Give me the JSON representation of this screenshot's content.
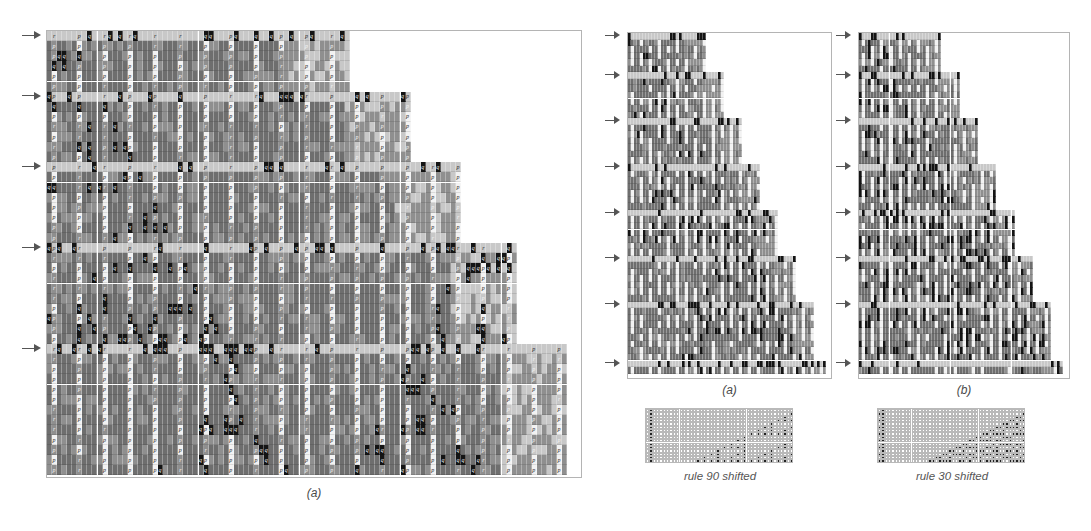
{
  "figure": {
    "title_visible": false,
    "background": "#ffffff"
  },
  "palette": {
    "cell_light": "#c8c8c8",
    "cell_mid": "#8f8f8f",
    "cell_dark": "#6e6e6e",
    "cell_white": "#f2f2f2",
    "cell_black": "#141414",
    "glyph_dark": "#2a2a2a",
    "glyph_light": "#f4f4f4",
    "frame": "#b4b4b4",
    "arrow": "#555555",
    "caption": "#4a4a4a",
    "minigrid_line": "#b9b9b9",
    "minicell_on": "#222222",
    "minicell_off": "#ffffff"
  },
  "panels": {
    "left": {
      "caption": "(a)",
      "name": "mobile-automaton-emulation-panel-a",
      "x": 46,
      "y": 30,
      "w": 536,
      "h": 448,
      "cell_w": 5.05,
      "cell_h": 10.1,
      "cols": 103,
      "rows": 44,
      "arrow_rows": [
        0,
        6,
        13,
        21,
        31
      ],
      "block_letters": [
        "p",
        "q",
        "r"
      ]
    },
    "mid": {
      "caption": "(a)",
      "name": "rule90-emulation-panel",
      "x": 627,
      "y": 32,
      "w": 205,
      "h": 347,
      "cell_w": 3.0,
      "cell_h": 6.55,
      "cols": 66,
      "rows": 52,
      "arrow_rows": [
        0,
        6,
        13,
        20,
        27,
        34,
        41,
        50
      ]
    },
    "right": {
      "caption": "(b)",
      "name": "rule30-emulation-panel",
      "x": 858,
      "y": 32,
      "w": 212,
      "h": 347,
      "cell_w": 3.05,
      "cell_h": 6.55,
      "cols": 67,
      "rows": 52,
      "arrow_rows": [
        0,
        6,
        13,
        20,
        27,
        34,
        41,
        50
      ]
    }
  },
  "mini": {
    "left": {
      "label": "rule 90 shifted",
      "name": "rule-90-shifted-minigrid",
      "x": 645,
      "y": 408,
      "w": 148,
      "h": 55,
      "cols": 44,
      "rows": 16,
      "cell": 3.35,
      "rule": 90,
      "shift": 1
    },
    "right": {
      "label": "rule 30 shifted",
      "name": "rule-30-shifted-minigrid",
      "x": 877,
      "y": 408,
      "w": 148,
      "h": 55,
      "cols": 44,
      "rows": 16,
      "cell": 3.35,
      "rule": 30,
      "shift": 1
    }
  },
  "captions": {
    "left_a": {
      "text": "(a)",
      "x": 46,
      "y": 486,
      "w": 536
    },
    "mid_a": {
      "text": "(a)",
      "x": 627,
      "y": 383,
      "w": 205
    },
    "right_b": {
      "text": "(b)",
      "x": 858,
      "y": 383,
      "w": 212
    },
    "mini_left": {
      "text": "rule 90 shifted",
      "x": 630,
      "y": 470,
      "w": 180
    },
    "mini_right": {
      "text": "rule 30 shifted",
      "x": 862,
      "y": 470,
      "w": 180
    }
  },
  "chart_data": {
    "type": "heatmap",
    "title": "",
    "panels": [
      {
        "id": "a-left",
        "caption": "(a)",
        "states": [
          "p",
          "q",
          "r"
        ],
        "shading_levels": [
          "light",
          "mid",
          "dark",
          "white",
          "black"
        ],
        "rows": 44,
        "cols": 103,
        "marked_rows": [
          0,
          6,
          13,
          21,
          31
        ],
        "staircase_steps": [
          {
            "row_start": 0,
            "row_end": 5,
            "right_col": 60
          },
          {
            "row_start": 6,
            "row_end": 12,
            "right_col": 72
          },
          {
            "row_start": 13,
            "row_end": 20,
            "right_col": 82
          },
          {
            "row_start": 21,
            "row_end": 30,
            "right_col": 93
          },
          {
            "row_start": 31,
            "row_end": 43,
            "right_col": 103
          }
        ]
      },
      {
        "id": "a-mid",
        "caption": "(a)",
        "rule": 90,
        "rows": 52,
        "cols": 66,
        "marked_rows": [
          0,
          6,
          13,
          20,
          27,
          34,
          41,
          50
        ],
        "staircase_steps": [
          {
            "row_start": 0,
            "row_end": 5,
            "right_col": 26
          },
          {
            "row_start": 6,
            "row_end": 12,
            "right_col": 32
          },
          {
            "row_start": 13,
            "row_end": 19,
            "right_col": 38
          },
          {
            "row_start": 20,
            "row_end": 26,
            "right_col": 44
          },
          {
            "row_start": 27,
            "row_end": 33,
            "right_col": 50
          },
          {
            "row_start": 34,
            "row_end": 40,
            "right_col": 56
          },
          {
            "row_start": 41,
            "row_end": 49,
            "right_col": 62
          },
          {
            "row_start": 50,
            "row_end": 51,
            "right_col": 66
          }
        ]
      },
      {
        "id": "b-right",
        "caption": "(b)",
        "rule": 30,
        "rows": 52,
        "cols": 67,
        "marked_rows": [
          0,
          6,
          13,
          20,
          27,
          34,
          41,
          50
        ],
        "staircase_steps": [
          {
            "row_start": 0,
            "row_end": 5,
            "right_col": 27
          },
          {
            "row_start": 6,
            "row_end": 12,
            "right_col": 33
          },
          {
            "row_start": 13,
            "row_end": 19,
            "right_col": 39
          },
          {
            "row_start": 20,
            "row_end": 26,
            "right_col": 45
          },
          {
            "row_start": 27,
            "row_end": 33,
            "right_col": 51
          },
          {
            "row_start": 34,
            "row_end": 40,
            "right_col": 57
          },
          {
            "row_start": 41,
            "row_end": 49,
            "right_col": 63
          },
          {
            "row_start": 50,
            "row_end": 51,
            "right_col": 67
          }
        ]
      }
    ],
    "mini_panels": [
      {
        "id": "rule-90-shifted",
        "label": "rule 90 shifted",
        "rule": 90,
        "rows": 16,
        "cols": 44
      },
      {
        "id": "rule-30-shifted",
        "label": "rule 30 shifted",
        "rule": 30,
        "rows": 16,
        "cols": 44
      }
    ]
  }
}
